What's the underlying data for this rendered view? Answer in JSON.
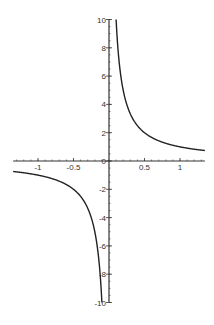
{
  "chart_data": {
    "type": "line",
    "title": "",
    "xlabel": "",
    "ylabel": "",
    "function": "y = 1/x",
    "xlim": [
      -1.35,
      1.35
    ],
    "ylim": [
      -10,
      10
    ],
    "grid": false,
    "legend": null,
    "x_ticks": [
      -1,
      -0.5,
      0,
      0.5,
      1
    ],
    "x_tick_labels": [
      "-1",
      "-0.5",
      "0.5",
      "1"
    ],
    "y_ticks": [
      -10,
      -8,
      -6,
      -4,
      -2,
      0,
      2,
      4,
      6,
      8,
      10
    ],
    "y_tick_labels": [
      "-10",
      "-8",
      "-6",
      "-4",
      "-2",
      "0",
      "2",
      "4",
      "6",
      "8",
      "10"
    ],
    "series": [
      {
        "name": "1/x (x>0)",
        "x": [
          0.1,
          0.125,
          0.15,
          0.2,
          0.25,
          0.3,
          0.4,
          0.5,
          0.6,
          0.7,
          0.8,
          0.9,
          1.0,
          1.1,
          1.2,
          1.35
        ],
        "y": [
          10,
          8,
          6.67,
          5,
          4,
          3.33,
          2.5,
          2,
          1.67,
          1.43,
          1.25,
          1.11,
          1.0,
          0.91,
          0.83,
          0.74
        ]
      },
      {
        "name": "1/x (x<0)",
        "x": [
          -1.35,
          -1.2,
          -1.1,
          -1.0,
          -0.9,
          -0.8,
          -0.7,
          -0.6,
          -0.5,
          -0.4,
          -0.3,
          -0.25,
          -0.2,
          -0.15,
          -0.125,
          -0.1
        ],
        "y": [
          -0.74,
          -0.83,
          -0.91,
          -1.0,
          -1.11,
          -1.25,
          -1.43,
          -1.67,
          -2,
          -2.5,
          -3.33,
          -4,
          -5,
          -6.67,
          -8,
          -10
        ]
      }
    ],
    "colors": {
      "curve": "#222222",
      "axis": "#333333",
      "background": "#ffffff"
    }
  }
}
